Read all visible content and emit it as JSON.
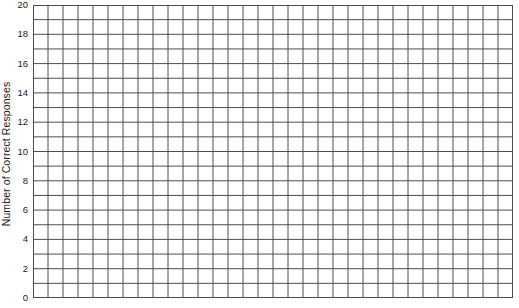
{
  "chart_data": {
    "type": "bar",
    "title": "",
    "subtitle": "",
    "xlabel": "",
    "ylabel": "Number of Correct Responses",
    "ylim": [
      0,
      20
    ],
    "ytick_labels": [
      "20",
      "18",
      "16",
      "14",
      "12",
      "10",
      "8",
      "6",
      "4",
      "2",
      "0"
    ],
    "ytick_values": [
      20,
      18,
      16,
      14,
      12,
      10,
      8,
      6,
      4,
      2,
      0
    ],
    "ytick_interval": 2,
    "y_minor_interval": 1,
    "categories": [],
    "values": [],
    "series": [],
    "grid": true,
    "grid_columns": 32,
    "grid_rows": 20,
    "legend": null,
    "legend_position": "none",
    "annotations": [],
    "note": "Empty data-recording grid; no bars or data plotted."
  },
  "figure": {
    "axis_title": "Number of Correct Responses",
    "grid_line_color": "#4d4d4d",
    "grid_line_color_light": "#8c8c8c",
    "background_color": "#ffffff",
    "text_color": "#1a1a1a"
  }
}
